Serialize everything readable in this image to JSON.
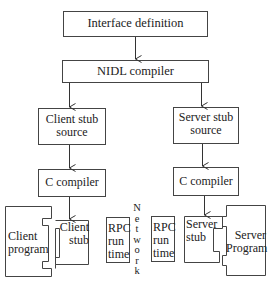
{
  "diagram": {
    "nodes": {
      "interface_definition": "Interface definition",
      "nidl_compiler": "NIDL compiler",
      "client_stub_source": [
        "Client stub",
        "source"
      ],
      "server_stub_source": [
        "Server stub",
        "source"
      ],
      "client_c_compiler": "C compiler",
      "server_c_compiler": "C compiler",
      "client_program": [
        "Client",
        "program"
      ],
      "client_stub": [
        "Client",
        "stub"
      ],
      "client_rpc_runtime": [
        "RPC",
        "run",
        "time"
      ],
      "server_rpc_runtime": [
        "RPC",
        "run",
        "time"
      ],
      "server_stub": [
        "Server",
        "stub"
      ],
      "server_program": [
        "Server",
        "Program"
      ]
    },
    "network_label": [
      "N",
      "e",
      "t",
      "w",
      "o",
      "r",
      "k"
    ],
    "edges": [
      [
        "Interface definition",
        "NIDL compiler"
      ],
      [
        "NIDL compiler",
        "Client stub source"
      ],
      [
        "NIDL compiler",
        "Server stub source"
      ],
      [
        "Client stub source",
        "C compiler (client)"
      ],
      [
        "Server stub source",
        "C compiler (server)"
      ],
      [
        "C compiler (client)",
        "Client stub"
      ],
      [
        "C compiler (server)",
        "Server stub"
      ]
    ]
  }
}
